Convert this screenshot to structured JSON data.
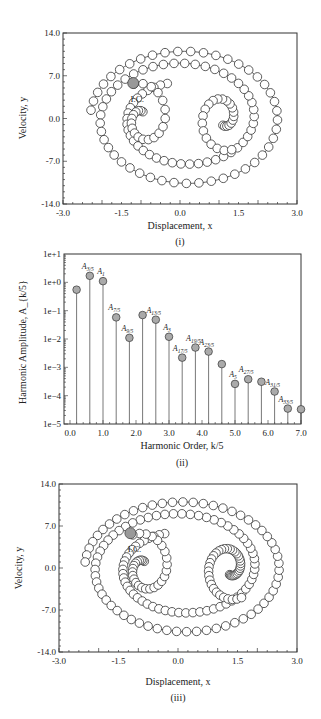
{
  "chart_data": [
    {
      "id": "i",
      "type": "scatter",
      "caption": "(i)",
      "xlabel": "Displacement, x",
      "ylabel": "Velocity, y",
      "xlim": [
        -3.0,
        3.0
      ],
      "ylim": [
        -14.0,
        14.0
      ],
      "xticks": [
        "-3.0",
        "-1.5",
        "0.0",
        "1.5",
        "3.0"
      ],
      "xtick_values": [
        -3.0,
        -1.5,
        0.0,
        1.5,
        3.0
      ],
      "yticks": [
        "14.0",
        "7.0",
        "0.0",
        "-7.0",
        "-14.0"
      ],
      "ytick_values": [
        14.0,
        7.0,
        0.0,
        -7.0,
        -14.0
      ],
      "annotation": {
        "label": "I.C.",
        "x": -1.2,
        "y": 5.8
      },
      "trajectory_note": "phase-plane trajectory sampled as open circles, initial condition filled grey",
      "orbit": {
        "outer_rx": 2.4,
        "outer_ry": 11.0,
        "center_x": 0.1,
        "center_y": 0.0,
        "inner_loop_left_x": -1.0,
        "inner_loop_right_x": 1.1,
        "dense_inner": false
      }
    },
    {
      "id": "ii",
      "type": "bar",
      "subtype": "stem-log",
      "caption": "(ii)",
      "xlabel": "Harmonic Order, k/5",
      "ylabel": "Harmonic Amplitude, A_{k/5}",
      "xlim": [
        0.0,
        7.0
      ],
      "ylim": [
        1e-05,
        10
      ],
      "yscale": "log",
      "xticks": [
        "0.0",
        "1.0",
        "2.0",
        "3.0",
        "4.0",
        "5.0",
        "6.0",
        "7.0"
      ],
      "xtick_values": [
        0,
        1,
        2,
        3,
        4,
        5,
        6,
        7
      ],
      "yticks": [
        "1e+1",
        "1e+0",
        "1e−1",
        "1e−2",
        "1e−3",
        "1e−4",
        "1e−5"
      ],
      "ytick_values": [
        10,
        1,
        0.1,
        0.01,
        0.001,
        0.0001,
        1e-05
      ],
      "points": [
        {
          "x": 0.2,
          "y": 0.55,
          "label": ""
        },
        {
          "x": 0.6,
          "y": 1.7,
          "label": "A",
          "sub": "3/5"
        },
        {
          "x": 1.0,
          "y": 1.1,
          "label": "A",
          "sub": "1"
        },
        {
          "x": 1.4,
          "y": 0.058,
          "label": "A",
          "sub": "7/5"
        },
        {
          "x": 1.8,
          "y": 0.011,
          "label": "A",
          "sub": "9/5"
        },
        {
          "x": 2.2,
          "y": 0.07,
          "label": "",
          "sub": ""
        },
        {
          "x": 2.6,
          "y": 0.048,
          "label": "A",
          "sub": "13/5"
        },
        {
          "x": 3.0,
          "y": 0.012,
          "label": "A",
          "sub": "3"
        },
        {
          "x": 3.4,
          "y": 0.0022,
          "label": "A",
          "sub": "17/5"
        },
        {
          "x": 3.8,
          "y": 0.005,
          "label": "A",
          "sub": "19/5"
        },
        {
          "x": 4.2,
          "y": 0.0036,
          "label": "A",
          "sub": "23/5"
        },
        {
          "x": 4.6,
          "y": 0.0013,
          "label": "",
          "sub": ""
        },
        {
          "x": 5.0,
          "y": 0.00026,
          "label": "A",
          "sub": "5"
        },
        {
          "x": 5.4,
          "y": 0.00038,
          "label": "A",
          "sub": "27/5"
        },
        {
          "x": 5.8,
          "y": 0.00031,
          "label": "",
          "sub": ""
        },
        {
          "x": 6.2,
          "y": 0.00014,
          "label": "A",
          "sub": "31/5"
        },
        {
          "x": 6.6,
          "y": 3.5e-05,
          "label": "A",
          "sub": "33/5"
        },
        {
          "x": 7.0,
          "y": 3.3e-05,
          "label": "",
          "sub": ""
        }
      ]
    },
    {
      "id": "iii",
      "type": "scatter",
      "caption": "(iii)",
      "xlabel": "Displacement, x",
      "ylabel": "Velocity, y",
      "xlim": [
        -3.0,
        3.0
      ],
      "ylim": [
        -14.0,
        14.0
      ],
      "xticks": [
        "-3.0",
        "-1.5",
        "0.0",
        "1.5",
        "3.0"
      ],
      "xtick_values": [
        -3.0,
        -1.5,
        0.0,
        1.5,
        3.0
      ],
      "yticks": [
        "14.0",
        "7.0",
        "0.0",
        "-7.0",
        "-14.0"
      ],
      "ytick_values": [
        14.0,
        7.0,
        0.0,
        -7.0,
        -14.0
      ],
      "annotation": {
        "label": "I.C.",
        "x": -1.2,
        "y": 5.8
      },
      "trajectory_note": "phase-plane trajectory sampled as open circles, initial condition filled grey",
      "orbit": {
        "outer_rx": 2.45,
        "outer_ry": 11.0,
        "center_x": 0.1,
        "center_y": 0.0,
        "inner_loop_left_x": -0.9,
        "inner_loop_right_x": 1.3,
        "dense_inner": true
      }
    }
  ]
}
